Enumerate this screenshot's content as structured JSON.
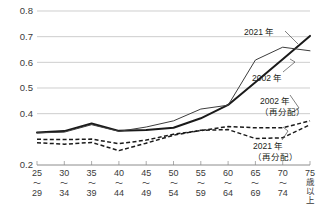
{
  "chart_data": {
    "type": "line",
    "title": "",
    "xlabel": "",
    "ylabel": "",
    "ylim": [
      0.2,
      0.8
    ],
    "yticks": [
      0.2,
      0.4,
      0.5,
      0.6,
      0.7,
      0.8
    ],
    "ytick_labels": [
      "0.2",
      "0.4",
      "0.5",
      "0.6",
      "0.7",
      "0.8"
    ],
    "grid": true,
    "legend_position": "inline-annotations",
    "categories": [
      "25〜29",
      "30〜34",
      "35〜39",
      "40〜44",
      "45〜49",
      "50〜54",
      "55〜59",
      "60〜64",
      "65〜69",
      "70〜74",
      "75歳以上"
    ],
    "category_parts": [
      {
        "top": "25",
        "wave": "〜",
        "bottom": "29"
      },
      {
        "top": "30",
        "wave": "〜",
        "bottom": "34"
      },
      {
        "top": "35",
        "wave": "〜",
        "bottom": "39"
      },
      {
        "top": "40",
        "wave": "〜",
        "bottom": "44"
      },
      {
        "top": "45",
        "wave": "〜",
        "bottom": "49"
      },
      {
        "top": "50",
        "wave": "〜",
        "bottom": "54"
      },
      {
        "top": "55",
        "wave": "〜",
        "bottom": "59"
      },
      {
        "top": "60",
        "wave": "〜",
        "bottom": "64"
      },
      {
        "top": "65",
        "wave": "〜",
        "bottom": "69"
      },
      {
        "top": "70",
        "wave": "〜",
        "bottom": "74"
      },
      {
        "top": "75",
        "wave": "",
        "bottom": "歳以上"
      }
    ],
    "series": [
      {
        "name": "2021年",
        "style": "solid-thick",
        "values": [
          0.327,
          0.332,
          0.362,
          0.333,
          0.336,
          0.345,
          0.382,
          0.434,
          0.522,
          0.612,
          0.703
        ]
      },
      {
        "name": "2002年",
        "style": "solid-thin",
        "values": [
          0.325,
          0.328,
          0.357,
          0.331,
          0.348,
          0.372,
          0.418,
          0.433,
          0.609,
          0.659,
          0.645
        ]
      },
      {
        "name": "2002年（再分配）",
        "style": "dashed",
        "values": [
          0.3,
          0.299,
          0.301,
          0.283,
          0.297,
          0.32,
          0.334,
          0.35,
          0.345,
          0.345,
          0.372
        ]
      },
      {
        "name": "2021年（再分配）",
        "style": "dashed",
        "values": [
          0.287,
          0.281,
          0.288,
          0.256,
          0.285,
          0.316,
          0.335,
          0.338,
          0.303,
          0.306,
          0.357
        ]
      }
    ],
    "annotations": [
      {
        "id": "ann-2021",
        "lines": [
          "2021 年"
        ]
      },
      {
        "id": "ann-2002",
        "lines": [
          "2002 年"
        ]
      },
      {
        "id": "ann-2002-redist",
        "lines": [
          "2002 年",
          "（再分配）"
        ]
      },
      {
        "id": "ann-2021-redist",
        "lines": [
          "2021 年",
          "（再分配）"
        ]
      }
    ],
    "colors": {
      "solid_thick": "#1a1a1a",
      "solid_thin": "#3d3d3d",
      "dashed": "#1a1a1a",
      "grid": "#b9b9b9",
      "text": "#231f20"
    }
  }
}
